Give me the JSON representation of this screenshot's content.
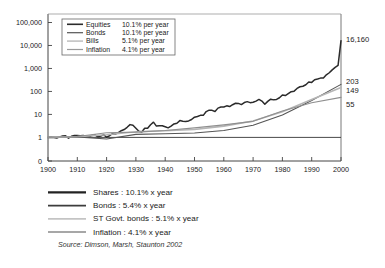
{
  "chart_data": {
    "type": "line",
    "title": "",
    "subtitle": "",
    "xlabel": "",
    "ylabel": "",
    "scale": "log",
    "grid": false,
    "legend_position": "top-left inside plot",
    "xlim": [
      1900,
      2000
    ],
    "ylim": [
      1,
      100000
    ],
    "ytick_labels": [
      "100,000",
      "10,000",
      "1,000",
      "100",
      "10",
      "1",
      "0"
    ],
    "ytick_values": [
      100000,
      10000,
      1000,
      100,
      10,
      1,
      0
    ],
    "xtick_labels": [
      "1900",
      "1910",
      "1920",
      "1930",
      "1940",
      "1950",
      "1960",
      "1970",
      "1980",
      "1990",
      "2000"
    ],
    "xtick_values": [
      1900,
      1910,
      1920,
      1930,
      1940,
      1950,
      1960,
      1970,
      1980,
      1990,
      2000
    ],
    "end_labels": [
      {
        "text": "16,160",
        "value": 16160,
        "series": "Equities"
      },
      {
        "text": "203",
        "value": 203,
        "series": "Bonds"
      },
      {
        "text": "149",
        "value": 149,
        "series": "Bills"
      },
      {
        "text": "55",
        "value": 55,
        "series": "Inflation"
      }
    ],
    "series": [
      {
        "name": "Equities",
        "color": "#2b2b2b",
        "width": 1.5,
        "x": [
          1900,
          1901,
          1902,
          1903,
          1904,
          1905,
          1906,
          1907,
          1908,
          1909,
          1910,
          1911,
          1912,
          1913,
          1914,
          1915,
          1916,
          1917,
          1918,
          1919,
          1920,
          1921,
          1922,
          1923,
          1924,
          1925,
          1926,
          1927,
          1928,
          1929,
          1930,
          1931,
          1932,
          1933,
          1934,
          1935,
          1936,
          1937,
          1938,
          1939,
          1940,
          1941,
          1942,
          1943,
          1944,
          1945,
          1946,
          1947,
          1948,
          1949,
          1950,
          1951,
          1952,
          1953,
          1954,
          1955,
          1956,
          1957,
          1958,
          1959,
          1960,
          1961,
          1962,
          1963,
          1964,
          1965,
          1966,
          1967,
          1968,
          1969,
          1970,
          1971,
          1972,
          1973,
          1974,
          1975,
          1976,
          1977,
          1978,
          1979,
          1980,
          1981,
          1982,
          1983,
          1984,
          1985,
          1986,
          1987,
          1988,
          1989,
          1990,
          1991,
          1992,
          1993,
          1994,
          1995,
          1996,
          1997,
          1998,
          1999,
          2000
        ],
        "values": [
          1.0,
          1.02,
          0.99,
          0.94,
          1.05,
          1.16,
          1.17,
          0.92,
          1.12,
          1.22,
          1.2,
          1.18,
          1.2,
          1.12,
          1.04,
          1.22,
          1.28,
          1.06,
          1.14,
          1.32,
          1.02,
          1.18,
          1.45,
          1.4,
          1.62,
          1.95,
          2.2,
          2.75,
          3.6,
          3.35,
          2.5,
          1.85,
          1.72,
          2.5,
          2.5,
          3.55,
          4.6,
          3.1,
          3.25,
          3.2,
          2.9,
          2.6,
          3.1,
          3.85,
          4.15,
          5.4,
          5.0,
          4.9,
          5.2,
          6.0,
          7.6,
          8.1,
          9.1,
          9.1,
          13.3,
          15.3,
          15.0,
          13.4,
          18.8,
          21.0,
          21.0,
          23.6,
          21.9,
          26.4,
          30.5,
          30.1,
          26.8,
          32.9,
          36.0,
          32.5,
          33.8,
          38.0,
          45.0,
          38.0,
          27.5,
          37.0,
          46.0,
          43.0,
          45.0,
          53.0,
          70.0,
          66.0,
          80.0,
          97.0,
          103.0,
          135.0,
          160.0,
          168.0,
          195.0,
          256.0,
          247.0,
          322.0,
          346.0,
          380.0,
          385.0,
          528.0,
          650.0,
          866.0,
          1115.0,
          1350.0,
          16160.0
        ]
      },
      {
        "name": "Bonds",
        "color": "#555555",
        "width": 1.1,
        "x": [
          1900,
          1910,
          1920,
          1930,
          1940,
          1950,
          1960,
          1970,
          1980,
          1990,
          2000
        ],
        "values": [
          1.0,
          1.05,
          0.85,
          1.35,
          1.45,
          1.55,
          2.0,
          3.4,
          9.5,
          40.0,
          203.0
        ]
      },
      {
        "name": "Bills",
        "color": "#b5b5b5",
        "width": 1.6,
        "x": [
          1900,
          1910,
          1920,
          1930,
          1940,
          1950,
          1960,
          1970,
          1980,
          1990,
          2000
        ],
        "values": [
          1.0,
          1.08,
          1.3,
          1.75,
          1.95,
          2.2,
          3.1,
          5.2,
          13.0,
          45.0,
          149.0
        ]
      },
      {
        "name": "Inflation",
        "color": "#8f8f8f",
        "width": 1.1,
        "x": [
          1900,
          1910,
          1920,
          1930,
          1940,
          1950,
          1960,
          1970,
          1980,
          1990,
          2000
        ],
        "values": [
          1.0,
          1.1,
          1.6,
          1.7,
          2.0,
          2.6,
          3.5,
          5.0,
          14.0,
          32.0,
          55.0
        ]
      }
    ]
  },
  "inner_legend": {
    "rows": [
      {
        "label": "Equities",
        "rate": "10.1% per year",
        "color": "#2b2b2b",
        "width": 1.6
      },
      {
        "label": "Bonds",
        "rate": "10.1% per year",
        "color": "#555555",
        "width": 1.2
      },
      {
        "label": "Bills",
        "rate": "5.1% per year",
        "color": "#c2c2c2",
        "width": 1.6
      },
      {
        "label": "Inflation",
        "rate": "4.1% per year",
        "color": "#9a9a9a",
        "width": 1.2
      }
    ]
  },
  "bottom_legend": {
    "rows": [
      {
        "label": "Shares : 10.1% x year",
        "color": "#222222",
        "width": 2.2
      },
      {
        "label": "Bonds : 5.4% x year",
        "color": "#3d3d3d",
        "width": 1.8
      },
      {
        "label": "ST Govt. bonds : 5.1% x year",
        "color": "#c4c4c4",
        "width": 1.8
      },
      {
        "label": "Inflation : 4.1% x year",
        "color": "#8a8a8a",
        "width": 1.6
      }
    ]
  },
  "source": {
    "text": "Source: Dimson, Marsh, Staunton 2002"
  }
}
